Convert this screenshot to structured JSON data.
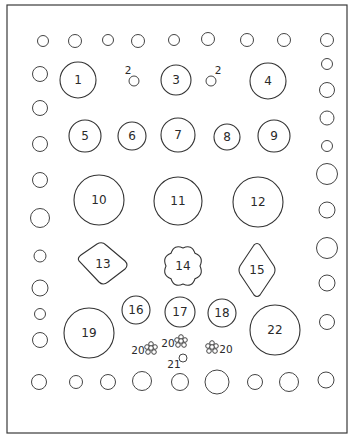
{
  "diagram": {
    "colors": {
      "stroke": "#333333",
      "background": "#ffffff"
    },
    "frame": {
      "x": 7,
      "y": 5,
      "w": 340,
      "h": 428
    },
    "top_row_circles": [
      {
        "cx": 43,
        "cy": 41,
        "r": 5.5
      },
      {
        "cx": 75,
        "cy": 41,
        "r": 6.5
      },
      {
        "cx": 108,
        "cy": 40,
        "r": 5.5
      },
      {
        "cx": 138,
        "cy": 41,
        "r": 6.5
      },
      {
        "cx": 174,
        "cy": 40,
        "r": 5.5
      },
      {
        "cx": 208,
        "cy": 39,
        "r": 6.5
      },
      {
        "cx": 247,
        "cy": 40,
        "r": 6.5
      },
      {
        "cx": 284,
        "cy": 40,
        "r": 6.5
      },
      {
        "cx": 327,
        "cy": 40,
        "r": 6.5
      }
    ],
    "bottom_row_circles": [
      {
        "cx": 39,
        "cy": 382,
        "r": 7.5
      },
      {
        "cx": 76,
        "cy": 382,
        "r": 6.5
      },
      {
        "cx": 108,
        "cy": 382,
        "r": 7.5
      },
      {
        "cx": 142,
        "cy": 381,
        "r": 9.5
      },
      {
        "cx": 180,
        "cy": 382,
        "r": 8.5
      },
      {
        "cx": 217,
        "cy": 382,
        "r": 12
      },
      {
        "cx": 255,
        "cy": 382,
        "r": 7.5
      },
      {
        "cx": 289,
        "cy": 382,
        "r": 9.5
      },
      {
        "cx": 326,
        "cy": 380,
        "r": 8
      }
    ],
    "left_column_circles": [
      {
        "cx": 40,
        "cy": 74,
        "r": 7.5
      },
      {
        "cx": 40,
        "cy": 108,
        "r": 7.5
      },
      {
        "cx": 40,
        "cy": 144,
        "r": 7.5
      },
      {
        "cx": 40,
        "cy": 180,
        "r": 7.5
      },
      {
        "cx": 40,
        "cy": 218,
        "r": 9.5
      },
      {
        "cx": 40,
        "cy": 256,
        "r": 6
      },
      {
        "cx": 40,
        "cy": 288,
        "r": 8
      },
      {
        "cx": 40,
        "cy": 314,
        "r": 5.5
      },
      {
        "cx": 40,
        "cy": 340,
        "r": 7.5
      }
    ],
    "right_column_circles": [
      {
        "cx": 327,
        "cy": 64,
        "r": 5.5
      },
      {
        "cx": 327,
        "cy": 90,
        "r": 7.5
      },
      {
        "cx": 327,
        "cy": 118,
        "r": 7
      },
      {
        "cx": 327,
        "cy": 146,
        "r": 5.5
      },
      {
        "cx": 327,
        "cy": 174,
        "r": 10.5
      },
      {
        "cx": 327,
        "cy": 210,
        "r": 8
      },
      {
        "cx": 327,
        "cy": 248,
        "r": 10.5
      },
      {
        "cx": 327,
        "cy": 283,
        "r": 8
      },
      {
        "cx": 327,
        "cy": 322,
        "r": 7.5
      }
    ],
    "numbered_circles": [
      {
        "id": "1",
        "label": "1",
        "cx": 78,
        "cy": 80,
        "r": 18
      },
      {
        "id": "2a",
        "label": "2",
        "cx": 134,
        "cy": 81,
        "r": 5,
        "label_dx": -6,
        "label_dy": -11,
        "small": true
      },
      {
        "id": "3",
        "label": "3",
        "cx": 176,
        "cy": 80,
        "r": 15
      },
      {
        "id": "2b",
        "label": "2",
        "cx": 211,
        "cy": 81,
        "r": 5,
        "label_dx": 7,
        "label_dy": -11,
        "small": true
      },
      {
        "id": "4",
        "label": "4",
        "cx": 268,
        "cy": 81,
        "r": 18
      },
      {
        "id": "5",
        "label": "5",
        "cx": 85,
        "cy": 136,
        "r": 16
      },
      {
        "id": "6",
        "label": "6",
        "cx": 132,
        "cy": 136,
        "r": 14
      },
      {
        "id": "7",
        "label": "7",
        "cx": 178,
        "cy": 135,
        "r": 17
      },
      {
        "id": "8",
        "label": "8",
        "cx": 227,
        "cy": 137,
        "r": 13
      },
      {
        "id": "9",
        "label": "9",
        "cx": 274,
        "cy": 136,
        "r": 16
      },
      {
        "id": "10",
        "label": "10",
        "cx": 99,
        "cy": 200,
        "r": 25
      },
      {
        "id": "11",
        "label": "11",
        "cx": 178,
        "cy": 201,
        "r": 24
      },
      {
        "id": "12",
        "label": "12",
        "cx": 258,
        "cy": 202,
        "r": 25
      },
      {
        "id": "16",
        "label": "16",
        "cx": 136,
        "cy": 310,
        "r": 14
      },
      {
        "id": "17",
        "label": "17",
        "cx": 180,
        "cy": 312,
        "r": 15
      },
      {
        "id": "18",
        "label": "18",
        "cx": 222,
        "cy": 313,
        "r": 14
      },
      {
        "id": "19",
        "label": "19",
        "cx": 89,
        "cy": 333,
        "r": 25
      },
      {
        "id": "21",
        "label": "21",
        "cx": 183,
        "cy": 358,
        "r": 4,
        "label_dx": -9,
        "label_dy": 6,
        "small": true
      },
      {
        "id": "22",
        "label": "22",
        "cx": 275,
        "cy": 330,
        "r": 25
      }
    ],
    "shapes": [
      {
        "id": "13",
        "label": "13",
        "type": "rounded-diamond",
        "cx": 103,
        "cy": 264
      },
      {
        "id": "14",
        "label": "14",
        "type": "cloud",
        "cx": 183,
        "cy": 266
      },
      {
        "id": "15",
        "label": "15",
        "type": "rounded-diamond-vertical",
        "cx": 257,
        "cy": 270
      }
    ],
    "flower_clusters": [
      {
        "id": "20a",
        "label": "20",
        "cx": 151,
        "cy": 348,
        "label_side": "left"
      },
      {
        "id": "20b",
        "label": "20",
        "cx": 181,
        "cy": 341,
        "label_side": "left"
      },
      {
        "id": "20c",
        "label": "20",
        "cx": 212,
        "cy": 347,
        "label_side": "right"
      }
    ]
  }
}
